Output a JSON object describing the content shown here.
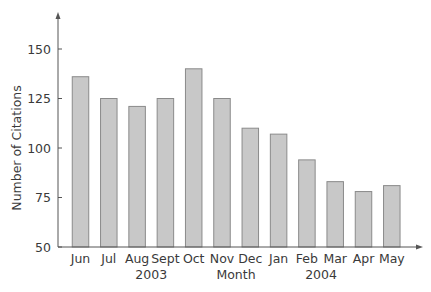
{
  "chart_data": {
    "type": "bar",
    "title": "",
    "xlabel": "Month",
    "ylabel": "Number of Citations",
    "categories": [
      "Jun",
      "Jul",
      "Aug",
      "Sept",
      "Oct",
      "Nov",
      "Dec",
      "Jan",
      "Feb",
      "Mar",
      "Apr",
      "May"
    ],
    "year_labels": [
      {
        "label": "2003",
        "center_between": [
          "Aug",
          "Sept"
        ]
      },
      {
        "label": "2004",
        "center_between": [
          "Feb",
          "Mar"
        ]
      }
    ],
    "values": [
      136,
      125,
      121,
      125,
      140,
      125,
      110,
      107,
      94,
      83,
      78,
      81
    ],
    "yticks": [
      50,
      75,
      100,
      125,
      150
    ],
    "ylim": [
      50,
      165
    ],
    "grid": false,
    "legend": null,
    "colors": {
      "bar_fill": "#c8c8c8",
      "bar_stroke": "#8a8a8a",
      "axis": "#555555",
      "text": "#3a3a3a"
    }
  }
}
